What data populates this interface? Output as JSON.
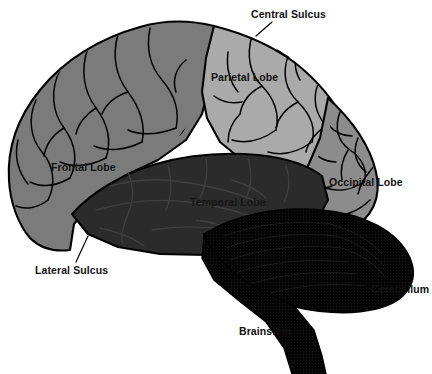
{
  "figure": {
    "background_color": "#ffffff",
    "width": 432,
    "height": 374
  },
  "palette": {
    "frontal_lobe_fill": "#7b7b7b",
    "parietal_lobe_fill": "#aaaaaa",
    "occipital_lobe_fill": "#8c8c8c",
    "temporal_lobe_fill": "#2b2b2b",
    "cerebellum_fill": "#050505",
    "brainstem_fill": "#050505",
    "outline_color": "#000000",
    "sulci_line_color": "#000000",
    "label_color": "#111111"
  },
  "labels": {
    "central_sulcus": "Central Sulcus",
    "parietal_lobe": "Parietal Lobe",
    "frontal_lobe": "Frontal Lobe",
    "temporal_lobe": "Temporal Lobe",
    "occipital_lobe": "Occipital Lobe",
    "lateral_sulcus": "Lateral Sulcus",
    "cerebellum": "Cerebellum",
    "brainstem": "Brainstem"
  },
  "regions": [
    {
      "name": "Frontal Lobe",
      "shade": "medium gray"
    },
    {
      "name": "Parietal Lobe",
      "shade": "light gray"
    },
    {
      "name": "Occipital Lobe",
      "shade": "medium gray"
    },
    {
      "name": "Temporal Lobe",
      "shade": "dark gray"
    },
    {
      "name": "Cerebellum",
      "shade": "black"
    },
    {
      "name": "Brainstem",
      "shade": "black"
    }
  ],
  "leader_lines": [
    {
      "label": "Central Sulcus",
      "from": [
        272,
        23
      ],
      "to": [
        257,
        35
      ]
    },
    {
      "label": "Lateral Sulcus",
      "from": [
        88,
        237
      ],
      "to": [
        77,
        261
      ]
    }
  ]
}
